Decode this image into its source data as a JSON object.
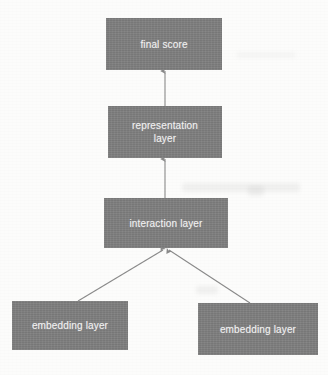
{
  "diagram": {
    "type": "flow-diagram",
    "direction": "bottom-to-top",
    "canvas": {
      "width": 328,
      "height": 375
    },
    "style": {
      "background_color": "#fcfcfb",
      "node_fill_color": "#7f7f7f",
      "node_text_color": "#f2f2f2",
      "edge_color": "#8a8a8a",
      "node_shape": "rectangle",
      "node_border": "none"
    },
    "nodes": [
      {
        "id": "final-score",
        "label": "final score",
        "level": 4,
        "x": 106,
        "y": 18,
        "width": 116,
        "height": 52
      },
      {
        "id": "representation-layer",
        "label": "representation\nlayer",
        "level": 3,
        "x": 108,
        "y": 106,
        "width": 114,
        "height": 52
      },
      {
        "id": "interaction-layer",
        "label": "interaction layer",
        "level": 2,
        "x": 104,
        "y": 198,
        "width": 124,
        "height": 50
      },
      {
        "id": "embedding-layer-left",
        "label": "embedding layer",
        "level": 1,
        "x": 12,
        "y": 301,
        "width": 116,
        "height": 49
      },
      {
        "id": "embedding-layer-right",
        "label": "embedding layer",
        "level": 1,
        "x": 198,
        "y": 303,
        "width": 120,
        "height": 52
      }
    ],
    "edges": [
      {
        "id": "edge-representation-to-final-score",
        "from": "representation-layer",
        "to": "final-score",
        "arrowhead": "to",
        "orientation": "vertical"
      },
      {
        "id": "edge-interaction-to-representation",
        "from": "interaction-layer",
        "to": "representation-layer",
        "arrowhead": "to",
        "orientation": "vertical"
      },
      {
        "id": "edge-embedding-left-to-interaction",
        "from": "embedding-layer-left",
        "to": "interaction-layer",
        "arrowhead": "to",
        "orientation": "diagonal"
      },
      {
        "id": "edge-embedding-right-to-interaction",
        "from": "embedding-layer-right",
        "to": "interaction-layer",
        "arrowhead": "to",
        "orientation": "diagonal"
      }
    ]
  }
}
